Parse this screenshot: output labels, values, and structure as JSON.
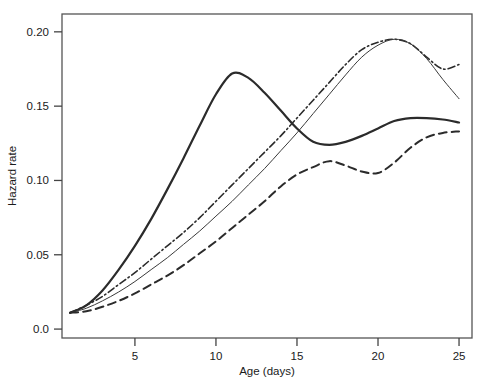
{
  "chart_data": {
    "type": "line",
    "title": "",
    "xlabel": "Age (days)",
    "ylabel": "Hazard rate",
    "xlim": [
      0.5,
      25.8
    ],
    "ylim": [
      -0.006,
      0.212
    ],
    "grid": false,
    "legend": "none",
    "xticks": [
      5,
      10,
      15,
      20,
      25
    ],
    "xtick_labels": [
      "5",
      "10",
      "15",
      "20",
      "25"
    ],
    "yticks": [
      0.0,
      0.05,
      0.1,
      0.15,
      0.2
    ],
    "ytick_labels": [
      "0.0",
      "0.05",
      "0.10",
      "0.15",
      "0.20"
    ],
    "x": [
      1,
      2,
      3,
      4,
      5,
      6,
      7,
      8,
      9,
      10,
      11,
      12,
      13,
      14,
      15,
      16,
      17,
      18,
      19,
      20,
      21,
      22,
      23,
      24,
      25
    ],
    "series": [
      {
        "name": "series-1",
        "style": "solid-thick",
        "linewidth": 2.2,
        "dash": "none",
        "color": "#2b2b2b",
        "values": [
          0.011,
          0.016,
          0.026,
          0.04,
          0.056,
          0.074,
          0.094,
          0.115,
          0.137,
          0.158,
          0.172,
          0.169,
          0.159,
          0.147,
          0.135,
          0.126,
          0.124,
          0.126,
          0.13,
          0.135,
          0.14,
          0.142,
          0.142,
          0.141,
          0.139
        ]
      },
      {
        "name": "series-2",
        "style": "dash-dot",
        "linewidth": 1.6,
        "dash": "7,3,1.5,3",
        "color": "#2b2b2b",
        "values": [
          0.011,
          0.016,
          0.022,
          0.03,
          0.038,
          0.047,
          0.056,
          0.065,
          0.075,
          0.086,
          0.097,
          0.108,
          0.119,
          0.13,
          0.142,
          0.154,
          0.166,
          0.178,
          0.188,
          0.193,
          0.195,
          0.192,
          0.183,
          0.175,
          0.178
        ]
      },
      {
        "name": "series-3",
        "style": "solid-thin",
        "linewidth": 1.0,
        "dash": "none",
        "color": "#3a3a3a",
        "values": [
          0.011,
          0.014,
          0.019,
          0.025,
          0.032,
          0.04,
          0.048,
          0.057,
          0.066,
          0.076,
          0.086,
          0.097,
          0.108,
          0.12,
          0.132,
          0.145,
          0.158,
          0.171,
          0.183,
          0.191,
          0.195,
          0.192,
          0.182,
          0.168,
          0.155
        ]
      },
      {
        "name": "series-4",
        "style": "dashed",
        "linewidth": 2.0,
        "dash": "8,5",
        "color": "#2b2b2b",
        "values": [
          0.011,
          0.012,
          0.015,
          0.019,
          0.024,
          0.03,
          0.036,
          0.043,
          0.051,
          0.059,
          0.068,
          0.077,
          0.086,
          0.096,
          0.104,
          0.109,
          0.113,
          0.11,
          0.106,
          0.105,
          0.112,
          0.122,
          0.129,
          0.132,
          0.133
        ]
      }
    ]
  },
  "axes": {
    "frame_color": "#555555"
  }
}
